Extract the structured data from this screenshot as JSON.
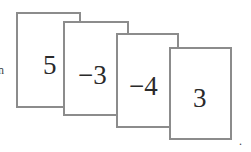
{
  "diagram": {
    "cards": [
      {
        "label": "5"
      },
      {
        "label": "−3"
      },
      {
        "label": "−4"
      },
      {
        "label": "3"
      }
    ],
    "trailing_punctuation": ".",
    "leading_fragment": "n",
    "colors": {
      "card_border": "#8c8c8c",
      "card_fill": "#ffffff",
      "text": "#2a2a2a"
    }
  }
}
